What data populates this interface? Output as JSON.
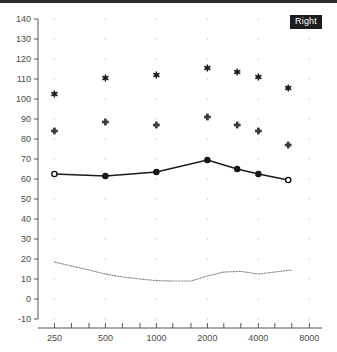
{
  "panel": {
    "ear_label": "Right",
    "ear_badge_bg": "#1c1c1c",
    "ear_badge_fg": "#ffffff",
    "top_rule_color": "#2b2b2b"
  },
  "chart_data": {
    "type": "line",
    "title": "",
    "subtitle": "",
    "xlabel": "",
    "ylabel": "",
    "xscale": "log",
    "x": [
      250,
      500,
      1000,
      2000,
      3000,
      4000,
      6000
    ],
    "xlim": [
      200,
      9500
    ],
    "ylim": [
      -10,
      140
    ],
    "ytick_labels": [
      "140",
      "130",
      "120",
      "110",
      "100",
      "90",
      "80",
      "70",
      "60",
      "50",
      "40",
      "30",
      "20",
      "10",
      "0",
      "-10"
    ],
    "yticks": [
      140,
      130,
      120,
      110,
      100,
      90,
      80,
      70,
      60,
      50,
      40,
      30,
      20,
      10,
      0,
      -10
    ],
    "xtick_labels": [
      "250",
      "500",
      "1000",
      "2000",
      "4000",
      "8000"
    ],
    "xticks": [
      250,
      500,
      1000,
      2000,
      4000,
      8000
    ],
    "xminor_ticks": [
      315,
      400,
      630,
      800,
      1250,
      1600,
      2500,
      3150,
      5000,
      6300
    ],
    "grid": "dotted-points",
    "legend": "none",
    "series": [
      {
        "name": "threshold",
        "marker": "open-circle",
        "line": "solid",
        "color": "#1a1a1a",
        "values": [
          62.5,
          61.5,
          63.5,
          69.5,
          65,
          62.5,
          59.5
        ]
      },
      {
        "name": "ucl-cross",
        "marker": "cross",
        "line": "none",
        "color": "#3a3a3a",
        "values": [
          84,
          88.5,
          87,
          91,
          87,
          84,
          77
        ]
      },
      {
        "name": "ucl-star",
        "marker": "asterisk",
        "line": "none",
        "color": "#1a1a1a",
        "values": [
          102.5,
          110.5,
          112,
          115.5,
          113.5,
          111,
          105.5
        ]
      },
      {
        "name": "noise-floor",
        "marker": "none",
        "line": "dotted",
        "color": "#8a8a8a",
        "x": [
          250,
          315,
          400,
          500,
          630,
          800,
          1000,
          1250,
          1600,
          2000,
          2500,
          3150,
          4000,
          5000,
          6300
        ],
        "values": [
          18.5,
          16.5,
          14.5,
          12.5,
          11.0,
          10.0,
          9.2,
          9.0,
          9.0,
          11.5,
          13.5,
          13.8,
          12.5,
          13.5,
          14.5
        ]
      }
    ]
  }
}
